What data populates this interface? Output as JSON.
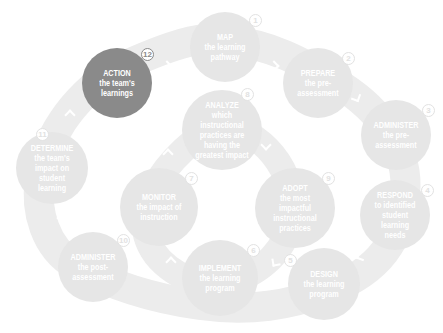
{
  "diagram": {
    "type": "cycle",
    "colors": {
      "band": "#ececec",
      "node": "#e6e6e6",
      "highlight_node": "#8a8a8a",
      "text": "#ffffff"
    },
    "steps": [
      {
        "n": "1",
        "verb": "MAP",
        "rest": "the learning pathway",
        "loop": "outer"
      },
      {
        "n": "2",
        "verb": "PREPARE",
        "rest": "the pre-assessment",
        "loop": "outer"
      },
      {
        "n": "3",
        "verb": "ADMINISTER",
        "rest": "the pre-assessment",
        "loop": "outer"
      },
      {
        "n": "4",
        "verb": "RESPOND",
        "rest": "to identified student learning needs",
        "loop": "outer"
      },
      {
        "n": "5",
        "verb": "DESIGN",
        "rest": "the learning program",
        "loop": "outer"
      },
      {
        "n": "6",
        "verb": "IMPLEMENT",
        "rest": "the learning program",
        "loop": "outer"
      },
      {
        "n": "7",
        "verb": "MONITOR",
        "rest": "the impact of instruction",
        "loop": "inner"
      },
      {
        "n": "8",
        "verb": "ANALYZE",
        "rest": "which instructional practices are having the greatest impact",
        "loop": "inner"
      },
      {
        "n": "9",
        "verb": "ADOPT",
        "rest": "the most impactful instructional practices",
        "loop": "inner"
      },
      {
        "n": "10",
        "verb": "ADMINISTER",
        "rest": "the post-assessment",
        "loop": "outer"
      },
      {
        "n": "11",
        "verb": "DETERMINE",
        "rest": "the team's impact on student learning",
        "loop": "outer"
      },
      {
        "n": "12",
        "verb": "ACTION",
        "rest": "the team's learnings",
        "loop": "outer",
        "highlighted": true
      }
    ]
  }
}
